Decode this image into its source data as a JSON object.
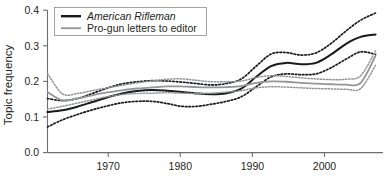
{
  "chart_data": {
    "type": "line",
    "title": "",
    "subtitle": "",
    "xlabel": "",
    "ylabel": "Topic frequency",
    "xlim": [
      1963,
      2008
    ],
    "ylim": [
      0.0,
      0.4
    ],
    "grid": false,
    "legend_position": "top-left",
    "xticks": [
      1970,
      1980,
      1990,
      2000
    ],
    "xtick_labels": [
      "1970",
      "1980",
      "1990",
      "2000"
    ],
    "yticks": [
      0.0,
      0.1,
      0.2,
      0.3,
      0.4
    ],
    "ytick_labels": [
      "0.0",
      "0.1",
      "0.2",
      "0.3",
      "0.4"
    ],
    "x": [
      1963,
      1965,
      1967,
      1969,
      1971,
      1973,
      1975,
      1977,
      1979,
      1981,
      1983,
      1985,
      1987,
      1989,
      1991,
      1993,
      1995,
      1997,
      1999,
      2001,
      2003,
      2005,
      2007
    ],
    "series": [
      {
        "name": "American Rifleman",
        "color": "#1a1a1a",
        "style": "solid",
        "width": 2.0,
        "values": [
          0.114,
          0.119,
          0.129,
          0.142,
          0.155,
          0.166,
          0.173,
          0.176,
          0.174,
          0.17,
          0.166,
          0.164,
          0.167,
          0.18,
          0.213,
          0.243,
          0.252,
          0.248,
          0.252,
          0.275,
          0.305,
          0.325,
          0.332
        ]
      },
      {
        "name": "American Rifleman upper CI",
        "color": "#1a1a1a",
        "style": "dashed",
        "width": 1.7,
        "values": [
          0.152,
          0.146,
          0.152,
          0.166,
          0.181,
          0.193,
          0.199,
          0.202,
          0.201,
          0.198,
          0.194,
          0.19,
          0.194,
          0.207,
          0.243,
          0.277,
          0.281,
          0.274,
          0.28,
          0.306,
          0.341,
          0.372,
          0.392
        ]
      },
      {
        "name": "American Rifleman lower CI",
        "color": "#1a1a1a",
        "style": "dashed",
        "width": 1.7,
        "values": [
          0.072,
          0.092,
          0.107,
          0.12,
          0.131,
          0.14,
          0.144,
          0.144,
          0.138,
          0.13,
          0.13,
          0.136,
          0.144,
          0.157,
          0.185,
          0.213,
          0.221,
          0.219,
          0.221,
          0.238,
          0.262,
          0.283,
          0.276
        ]
      },
      {
        "name": "Pro-gun letters to editor",
        "color": "#939598",
        "style": "solid",
        "width": 1.8,
        "values": [
          0.17,
          0.147,
          0.152,
          0.161,
          0.169,
          0.175,
          0.18,
          0.183,
          0.186,
          0.186,
          0.184,
          0.183,
          0.184,
          0.187,
          0.196,
          0.2,
          0.199,
          0.196,
          0.194,
          0.192,
          0.191,
          0.196,
          0.272
        ]
      },
      {
        "name": "Pro-gun letters upper CI",
        "color": "#939598",
        "style": "dashed",
        "width": 1.5,
        "values": [
          0.222,
          0.165,
          0.166,
          0.174,
          0.182,
          0.189,
          0.196,
          0.201,
          0.206,
          0.207,
          0.203,
          0.199,
          0.199,
          0.201,
          0.211,
          0.216,
          0.214,
          0.21,
          0.207,
          0.205,
          0.206,
          0.216,
          0.286
        ]
      },
      {
        "name": "Pro-gun letters lower CI",
        "color": "#939598",
        "style": "dashed",
        "width": 1.5,
        "values": [
          0.122,
          0.13,
          0.139,
          0.148,
          0.157,
          0.163,
          0.166,
          0.167,
          0.168,
          0.167,
          0.166,
          0.167,
          0.17,
          0.174,
          0.182,
          0.185,
          0.184,
          0.182,
          0.18,
          0.179,
          0.178,
          0.18,
          0.245
        ]
      }
    ],
    "legend": [
      {
        "label": "American Rifleman",
        "color": "#1a1a1a",
        "style": "italic"
      },
      {
        "label": "Pro-gun letters to editor",
        "color": "#939598",
        "style": "normal"
      }
    ]
  },
  "axis": {
    "y_title": "Topic frequency"
  }
}
